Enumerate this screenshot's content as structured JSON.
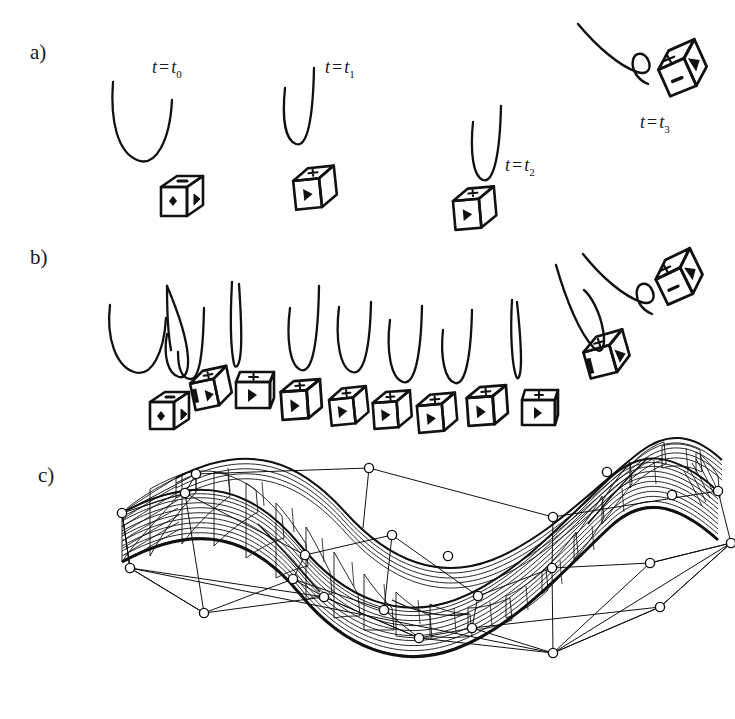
{
  "figure": {
    "kind": "multi-panel line-art figure",
    "background": "#ffffff",
    "ink_color": "#111111",
    "width": 735,
    "height": 719
  },
  "panels": [
    {
      "id": "a",
      "label": "a)",
      "x": 30,
      "y": 47,
      "caption_free": true,
      "description": "sparse keyframes of a tumbling cube with trajectory arcs"
    },
    {
      "id": "b",
      "label": "b)",
      "x": 30,
      "y": 252,
      "description": "densely sampled keyframes of the same tumbling cube motion"
    },
    {
      "id": "c",
      "label": "c)",
      "x": 38,
      "y": 470,
      "description": "spacetime B-spline surface with control net and control points"
    }
  ],
  "time_labels": [
    {
      "id": "t0",
      "text": "t",
      "eq": "=",
      "sub_base": "t",
      "sub": "0",
      "x": 152,
      "y": 62
    },
    {
      "id": "t1",
      "text": "t",
      "eq": "=",
      "sub_base": "t",
      "sub": "1",
      "x": 325,
      "y": 62
    },
    {
      "id": "t2",
      "text": "t",
      "eq": "=",
      "sub_base": "t",
      "sub": "2",
      "x": 505,
      "y": 160
    },
    {
      "id": "t3",
      "text": "t",
      "eq": "=",
      "sub_base": "t",
      "sub": "3",
      "x": 640,
      "y": 117
    }
  ],
  "panel_a": {
    "curves": [
      {
        "name": "trajectory-arc-t0",
        "shape": "wide-U",
        "x": 112,
        "y": 78,
        "w": 66,
        "h": 88,
        "rot": 0
      },
      {
        "name": "trajectory-arc-t1",
        "shape": "narrow-U",
        "x": 282,
        "y": 66,
        "w": 40,
        "h": 86,
        "rot": 0
      },
      {
        "name": "trajectory-arc-t2",
        "shape": "narrow-U",
        "x": 472,
        "y": 104,
        "w": 36,
        "h": 86,
        "rot": 0
      },
      {
        "name": "trajectory-arc-t3",
        "shape": "swoop-hook",
        "x": 575,
        "y": 20,
        "w": 95,
        "h": 62,
        "rot": 0
      }
    ],
    "cubes": [
      {
        "name": "die-t0",
        "x": 161,
        "y": 176,
        "size": 42,
        "rot": 0,
        "faces": {
          "top": "dash",
          "left": "diamond",
          "right": "triangle"
        }
      },
      {
        "name": "die-t1",
        "x": 292,
        "y": 170,
        "size": 42,
        "rot": -8,
        "faces": {
          "top": "plus",
          "left": "triangle",
          "right": "dark"
        }
      },
      {
        "name": "die-t2",
        "x": 452,
        "y": 190,
        "size": 42,
        "rot": -6,
        "faces": {
          "top": "plus",
          "left": "triangle",
          "right": "dark"
        }
      },
      {
        "name": "die-t3",
        "x": 651,
        "y": 61,
        "size": 48,
        "rot": -32,
        "faces": {
          "top": "plus",
          "left": "dash",
          "right": "triangle"
        }
      }
    ]
  },
  "panel_b": {
    "curve_count": 12,
    "cube_count": 10,
    "curves": [
      {
        "name": "arc-b-1",
        "shape": "wide-U",
        "x": 105,
        "y": 300,
        "w": 58,
        "h": 72
      },
      {
        "name": "arc-b-2",
        "shape": "narrow-U",
        "x": 162,
        "y": 278,
        "w": 32,
        "h": 86
      },
      {
        "name": "arc-b-3",
        "shape": "narrow-U",
        "x": 172,
        "y": 296,
        "w": 30,
        "h": 66
      },
      {
        "name": "arc-b-4",
        "shape": "sliver",
        "x": 228,
        "y": 277,
        "w": 12,
        "h": 82
      },
      {
        "name": "arc-b-5",
        "shape": "narrow-U",
        "x": 283,
        "y": 280,
        "w": 30,
        "h": 86
      },
      {
        "name": "arc-b-6",
        "shape": "narrow-U",
        "x": 336,
        "y": 297,
        "w": 34,
        "h": 78
      },
      {
        "name": "arc-b-7",
        "shape": "narrow-U",
        "x": 387,
        "y": 300,
        "w": 32,
        "h": 80
      },
      {
        "name": "arc-b-8",
        "shape": "narrow-U",
        "x": 440,
        "y": 310,
        "w": 30,
        "h": 76
      },
      {
        "name": "arc-b-9",
        "shape": "sliver",
        "x": 510,
        "y": 298,
        "w": 10,
        "h": 76
      },
      {
        "name": "arc-b-10",
        "shape": "lean-U",
        "x": 548,
        "y": 264,
        "w": 44,
        "h": 92
      },
      {
        "name": "arc-b-11",
        "shape": "swoop-hook",
        "x": 578,
        "y": 252,
        "w": 96,
        "h": 62
      }
    ],
    "cubes": [
      {
        "name": "die-b-1",
        "x": 160,
        "y": 390,
        "size": 40,
        "rot": 0,
        "faces": {
          "top": "dash",
          "left": "diamond",
          "right": "triangle"
        }
      },
      {
        "name": "die-b-2",
        "x": 196,
        "y": 376,
        "size": 40,
        "rot": -12,
        "faces": {
          "top": "plus",
          "left": "triangle",
          "right": "dark"
        }
      },
      {
        "name": "die-b-3",
        "x": 240,
        "y": 374,
        "size": 38,
        "rot": 0,
        "faces": {
          "top": "plus",
          "left": "triangle",
          "right": "none"
        }
      },
      {
        "name": "die-b-4",
        "x": 283,
        "y": 383,
        "size": 42,
        "rot": -4,
        "faces": {
          "top": "plus",
          "left": "triangle",
          "right": "dark"
        }
      },
      {
        "name": "die-b-5",
        "x": 330,
        "y": 389,
        "size": 38,
        "rot": -6,
        "faces": {
          "top": "plus",
          "left": "triangle",
          "right": "dark"
        }
      },
      {
        "name": "die-b-6",
        "x": 374,
        "y": 393,
        "size": 38,
        "rot": -4,
        "faces": {
          "top": "plus",
          "left": "triangle",
          "right": "dark"
        }
      },
      {
        "name": "die-b-7",
        "x": 418,
        "y": 395,
        "size": 40,
        "rot": -6,
        "faces": {
          "top": "plus",
          "left": "triangle",
          "right": "dark"
        }
      },
      {
        "name": "die-b-8",
        "x": 469,
        "y": 389,
        "size": 40,
        "rot": -4,
        "faces": {
          "top": "plus",
          "left": "triangle",
          "right": "dark"
        }
      },
      {
        "name": "die-b-9",
        "x": 525,
        "y": 390,
        "size": 36,
        "rot": 0,
        "faces": {
          "top": "plus",
          "left": "triangle",
          "right": "none"
        }
      },
      {
        "name": "die-b-10",
        "x": 587,
        "y": 342,
        "size": 42,
        "rot": -18,
        "faces": {
          "top": "plus",
          "left": "dark",
          "right": "triangle"
        }
      },
      {
        "name": "die-b-11",
        "x": 648,
        "y": 272,
        "size": 48,
        "rot": -30,
        "faces": {
          "top": "plus",
          "left": "dash",
          "right": "triangle"
        }
      }
    ]
  },
  "panel_c": {
    "surface": {
      "type": "spacetime-b-spline-surface",
      "shape": "S-wave-trough",
      "u_lines": 46,
      "v_lines": 18,
      "stroke": "#111111"
    },
    "control_net": {
      "point_marker": "open-circle",
      "point_radius": 4.5,
      "point_fill": "#ffffff",
      "point_stroke": "#111111",
      "edge_stroke": "#111111",
      "point_count": 24
    }
  }
}
